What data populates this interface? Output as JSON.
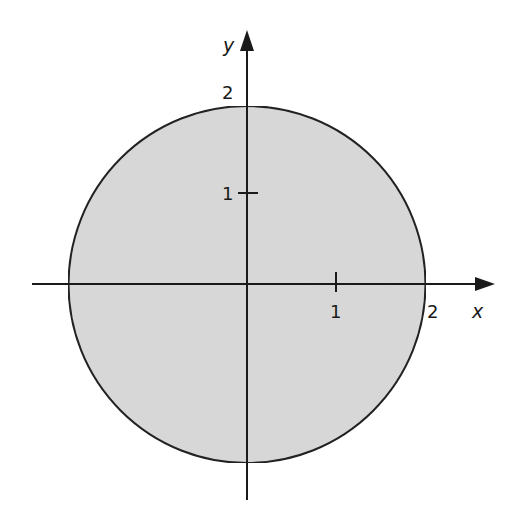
{
  "figure": {
    "axes": {
      "x_label": "x",
      "y_label": "y",
      "x_ticks": [
        {
          "value": 1,
          "label": "1"
        },
        {
          "value": 2,
          "label": "2"
        }
      ],
      "y_ticks": [
        {
          "value": 1,
          "label": "1"
        },
        {
          "value": 2,
          "label": "2"
        }
      ]
    },
    "region": {
      "shape": "circle",
      "center": [
        0,
        0
      ],
      "radius": 2,
      "fill_color": "#d9d9d9",
      "stroke_color": "#222222"
    }
  }
}
